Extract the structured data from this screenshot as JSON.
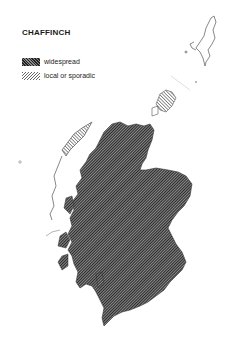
{
  "map": {
    "title": "CHAFFINCH",
    "region": "Scotland",
    "legend": [
      {
        "label": "widespread",
        "pattern": "dense-crosshatch",
        "color": "#333333"
      },
      {
        "label": "local or sporadic",
        "pattern": "light-diagonal-hatch",
        "color": "#888888"
      }
    ]
  }
}
